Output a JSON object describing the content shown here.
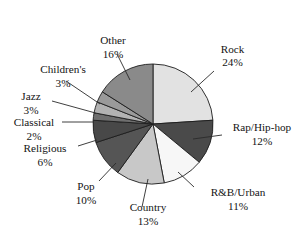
{
  "chart_data": {
    "type": "pie",
    "title": "",
    "subtitle": "",
    "xlabel": "",
    "ylabel": "",
    "legend_position": "none",
    "grid": false,
    "labels_outside": true,
    "start_angle_deg": 0,
    "direction": "clockwise",
    "categories": [
      "Rock",
      "Rap/Hip-hop",
      "R&B/Urban",
      "Country",
      "Pop",
      "Religious",
      "Classical",
      "Jazz",
      "Children's",
      "Other"
    ],
    "values": [
      24,
      12,
      11,
      13,
      10,
      6,
      2,
      3,
      3,
      16
    ],
    "value_labels": [
      "24%",
      "12%",
      "11%",
      "13%",
      "10%",
      "6%",
      "2%",
      "3%",
      "3%",
      "16%"
    ],
    "units": "percent",
    "total": 100,
    "colors": [
      "#e2e2e2",
      "#4a4a4a",
      "#f7f7f7",
      "#c8c8c8",
      "#555555",
      "#484848",
      "#6e6e6e",
      "#b2b2b2",
      "#9a9a9a",
      "#8a8a8a"
    ],
    "slices": [
      {
        "name": "Rock",
        "value": 24,
        "value_label": "24%",
        "color": "#e2e2e2"
      },
      {
        "name": "Rap/Hip-hop",
        "value": 12,
        "value_label": "12%",
        "color": "#4a4a4a"
      },
      {
        "name": "R&B/Urban",
        "value": 11,
        "value_label": "11%",
        "color": "#f7f7f7"
      },
      {
        "name": "Country",
        "value": 13,
        "value_label": "13%",
        "color": "#c8c8c8"
      },
      {
        "name": "Pop",
        "value": 10,
        "value_label": "10%",
        "color": "#555555"
      },
      {
        "name": "Religious",
        "value": 6,
        "value_label": "6%",
        "color": "#484848"
      },
      {
        "name": "Classical",
        "value": 2,
        "value_label": "2%",
        "color": "#6e6e6e"
      },
      {
        "name": "Jazz",
        "value": 3,
        "value_label": "3%",
        "color": "#b2b2b2"
      },
      {
        "name": "Children's",
        "value": 3,
        "value_label": "3%",
        "color": "#9a9a9a"
      },
      {
        "name": "Other",
        "value": 16,
        "value_label": "16%",
        "color": "#8a8a8a"
      }
    ]
  },
  "labels": {
    "rock_name": "Rock",
    "rock_pct": "24%",
    "rap_name": "Rap/Hip-hop",
    "rap_pct": "12%",
    "rnb_name": "R&B/Urban",
    "rnb_pct": "11%",
    "country_name": "Country",
    "country_pct": "13%",
    "pop_name": "Pop",
    "pop_pct": "10%",
    "religious_name": "Religious",
    "religious_pct": "6%",
    "classical_name": "Classical",
    "classical_pct": "2%",
    "jazz_name": "Jazz",
    "jazz_pct": "3%",
    "childrens_name": "Children's",
    "childrens_pct": "3%",
    "other_name": "Other",
    "other_pct": "16%"
  }
}
